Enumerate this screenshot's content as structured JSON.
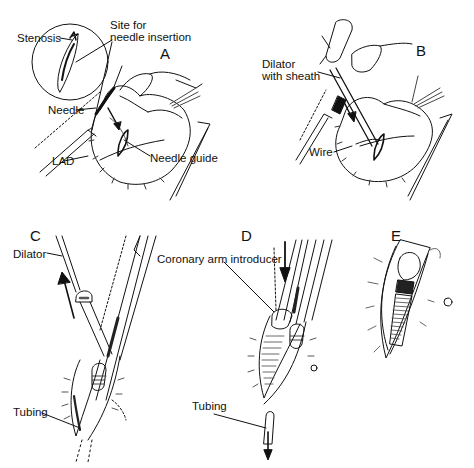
{
  "figure": {
    "type": "surgical procedure illustration",
    "colors": {
      "ink": "#111111",
      "background": "#ffffff",
      "shade": "#777777"
    },
    "panels": [
      {
        "id": "A",
        "letter": "A",
        "labels": {
          "stenosis": "Stenosis",
          "site_line1": "Site for",
          "site_line2": "needle insertion",
          "needle": "Needle",
          "lad": "LAD",
          "needle_guide": "Needle guide"
        }
      },
      {
        "id": "B",
        "letter": "B",
        "labels": {
          "dilator_line1": "Dilator",
          "dilator_line2": "with sheath",
          "wire": "Wire"
        }
      },
      {
        "id": "C",
        "letter": "C",
        "labels": {
          "dilator": "Dilator",
          "tubing": "Tubing"
        }
      },
      {
        "id": "D",
        "letter": "D",
        "labels": {
          "introducer": "Coronary arm introducer",
          "tubing": "Tubing"
        }
      },
      {
        "id": "E",
        "letter": "E",
        "labels": {}
      }
    ]
  }
}
